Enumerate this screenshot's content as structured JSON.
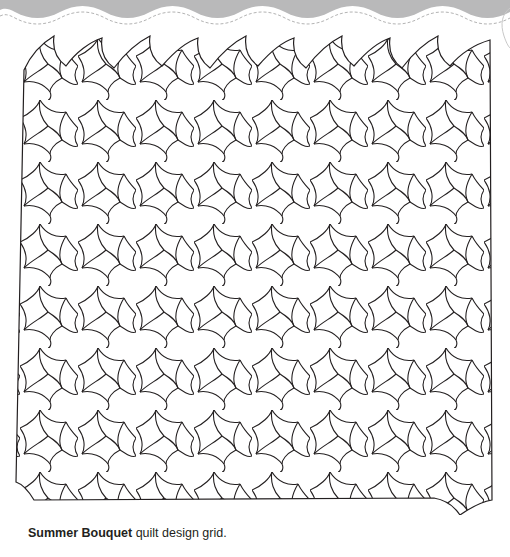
{
  "header": {
    "band_color": "#b9b9ba",
    "band_edge_color": "#e0e0e0",
    "stitch_color": "#9a9a9a",
    "decor": [
      "wavy-band",
      "dashed-stitch-line",
      "page-curl"
    ]
  },
  "figure": {
    "name": "Summer Bouquet",
    "line_color": "#231f20",
    "fill_color": "#ffffff",
    "columns_approx": 8,
    "rows_approx": 8
  },
  "caption": {
    "bold": "Summer Bouquet",
    "rest": " quilt design grid."
  }
}
